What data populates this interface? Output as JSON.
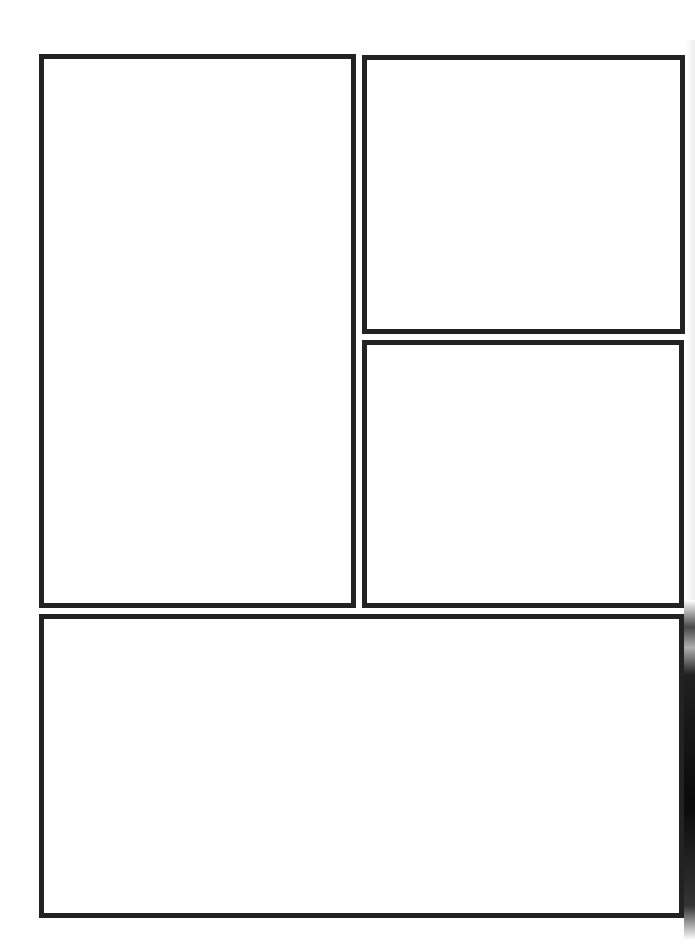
{
  "page": {
    "title": "",
    "background": "#ffffff",
    "border_color": "#222222"
  },
  "panels": [
    {
      "id": "panel-1",
      "label": "",
      "position": "left-tall"
    },
    {
      "id": "panel-2",
      "label": "",
      "position": "top-right"
    },
    {
      "id": "panel-3",
      "label": "",
      "position": "middle-right"
    },
    {
      "id": "panel-4",
      "label": "",
      "position": "bottom-wide"
    }
  ]
}
